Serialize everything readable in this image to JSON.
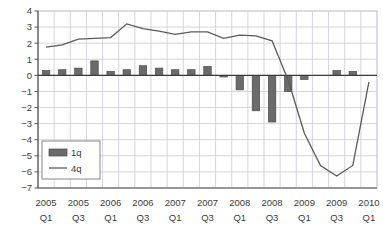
{
  "chart_data": {
    "type": "bar",
    "title": "",
    "subtitle": "",
    "xlabel": "",
    "ylabel": "",
    "ylim": [
      -7,
      4
    ],
    "ytick_values": [
      4,
      3,
      2,
      1,
      0,
      -1,
      -2,
      -3,
      -4,
      -5,
      -6,
      -7
    ],
    "ytick_labels": [
      "4",
      "3",
      "2",
      "1",
      "0",
      "−1",
      "−2",
      "−3",
      "−4",
      "−5",
      "−6",
      "−7"
    ],
    "grid": true,
    "legend_position": "lower-left-inside",
    "x": [
      "2005 Q1",
      "2005 Q2",
      "2005 Q3",
      "2005 Q4",
      "2006 Q1",
      "2006 Q2",
      "2006 Q3",
      "2006 Q4",
      "2007 Q1",
      "2007 Q2",
      "2007 Q3",
      "2007 Q4",
      "2008 Q1",
      "2008 Q2",
      "2008 Q3",
      "2008 Q4",
      "2009 Q1",
      "2009 Q2",
      "2009 Q3",
      "2009 Q4",
      "2010 Q1"
    ],
    "xtick_labels": [
      {
        "year": "2005",
        "quarter": "Q1",
        "index": 0
      },
      {
        "year": "2005",
        "quarter": "Q3",
        "index": 2
      },
      {
        "year": "2006",
        "quarter": "Q1",
        "index": 4
      },
      {
        "year": "2006",
        "quarter": "Q3",
        "index": 6
      },
      {
        "year": "2007",
        "quarter": "Q1",
        "index": 8
      },
      {
        "year": "2007",
        "quarter": "Q3",
        "index": 10
      },
      {
        "year": "2008",
        "quarter": "Q1",
        "index": 12
      },
      {
        "year": "2008",
        "quarter": "Q3",
        "index": 14
      },
      {
        "year": "2009",
        "quarter": "Q1",
        "index": 16
      },
      {
        "year": "2009",
        "quarter": "Q3",
        "index": 18
      },
      {
        "year": "2010",
        "quarter": "Q1",
        "index": 20
      }
    ],
    "series": [
      {
        "name": "1q",
        "kind": "bar",
        "color": "#6b6b6b",
        "values": [
          0.3,
          0.35,
          0.45,
          0.9,
          0.25,
          0.35,
          0.6,
          0.45,
          0.35,
          0.35,
          0.55,
          -0.1,
          -0.9,
          -2.2,
          -2.9,
          -1.0,
          -0.25,
          0.0,
          0.3,
          0.25,
          0.0
        ]
      },
      {
        "name": "4q",
        "kind": "line",
        "color": "#5a5a5a",
        "values": [
          1.75,
          1.9,
          2.25,
          2.3,
          2.35,
          3.2,
          2.9,
          2.75,
          2.55,
          2.7,
          2.7,
          2.3,
          2.5,
          2.45,
          2.15,
          -0.3,
          -3.6,
          -5.6,
          -6.25,
          -5.6,
          -0.4
        ]
      }
    ],
    "legend": [
      {
        "label": "1q",
        "marker": "bar"
      },
      {
        "label": "4q",
        "marker": "line"
      }
    ]
  },
  "colors": {
    "bar": "#6b6b6b",
    "bar_edge": "#4a4a4a",
    "line": "#5a5a5a",
    "grid": "#c9c9d6",
    "axis": "#555555",
    "zero_line": "#3a3a3a",
    "text": "#3a3a3a",
    "background": "#ffffff"
  }
}
